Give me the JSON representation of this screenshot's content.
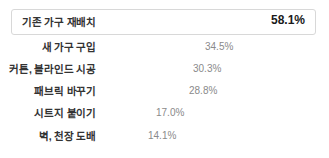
{
  "chart_data": {
    "type": "bar",
    "orientation": "horizontal",
    "title": "",
    "xlabel": "",
    "ylabel": "",
    "grid": false,
    "legend": null,
    "xlim": [
      0,
      58.1
    ],
    "categories": [
      "기존 가구 재배치",
      "새 가구 구입",
      "커튼, 블라인드 시공",
      "패브릭 바꾸기",
      "시트지 붙이기",
      "벽, 천장 도배"
    ],
    "values": [
      58.1,
      34.5,
      30.3,
      28.8,
      17.0,
      14.1
    ],
    "value_labels": [
      "58.1%",
      "34.5%",
      "30.3%",
      "28.8%",
      "17.0%",
      "14.1%"
    ],
    "highlighted_index": 0,
    "colors": {
      "highlight_bar": "#6e6e6e",
      "bar": "#dcdcdc",
      "highlight_box_border": "#d8d8d8",
      "label_text": "#333333",
      "value_text": "#8a8a8a",
      "highlight_value_text": "#1a1a1a",
      "background": "#ffffff"
    }
  },
  "rows": [
    {
      "label": "기존 가구 재배치",
      "value": "58.1%"
    },
    {
      "label": "새 가구 구입",
      "value": "34.5%"
    },
    {
      "label": "커튼, 블라인드 시공",
      "value": "30.3%"
    },
    {
      "label": "패브릭 바꾸기",
      "value": "28.8%"
    },
    {
      "label": "시트지 붙이기",
      "value": "17.0%"
    },
    {
      "label": "벽, 천장 도배",
      "value": "14.1%"
    }
  ]
}
